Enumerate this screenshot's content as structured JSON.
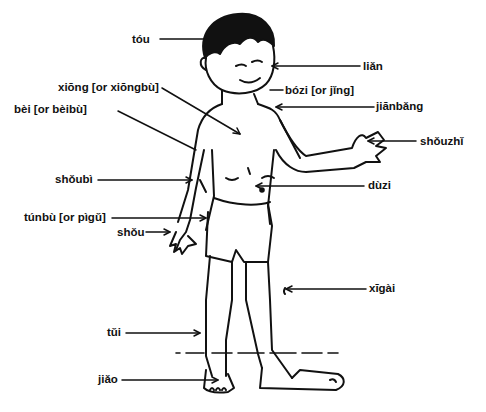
{
  "diagram": {
    "labels": [
      {
        "id": "tou",
        "text": "tóu",
        "x": 132,
        "y": 34
      },
      {
        "id": "lian",
        "text": "liǎn",
        "x": 363,
        "y": 62
      },
      {
        "id": "xiong",
        "text": "xiōng [or xiōngbù]",
        "x": 58,
        "y": 82
      },
      {
        "id": "bozi",
        "text": "bózi [or jǐng]",
        "x": 285,
        "y": 86
      },
      {
        "id": "bei",
        "text": "bèi [or bèibù]",
        "x": 14,
        "y": 104
      },
      {
        "id": "jianbang",
        "text": "jiānbǎng",
        "x": 376,
        "y": 102
      },
      {
        "id": "shouzhi",
        "text": "shǒuzhǐ",
        "x": 420,
        "y": 136
      },
      {
        "id": "shoubi",
        "text": "shǒubì",
        "x": 55,
        "y": 174
      },
      {
        "id": "duzi",
        "text": "dùzi",
        "x": 368,
        "y": 181
      },
      {
        "id": "tunbu",
        "text": "túnbù [or pìgǔ]",
        "x": 24,
        "y": 212
      },
      {
        "id": "shou",
        "text": "shǒu",
        "x": 117,
        "y": 227
      },
      {
        "id": "xigai",
        "text": "xīgài",
        "x": 369,
        "y": 284
      },
      {
        "id": "tui",
        "text": "tǔi",
        "x": 107,
        "y": 328
      },
      {
        "id": "jiao",
        "text": "jiǎo",
        "x": 98,
        "y": 374
      }
    ]
  }
}
